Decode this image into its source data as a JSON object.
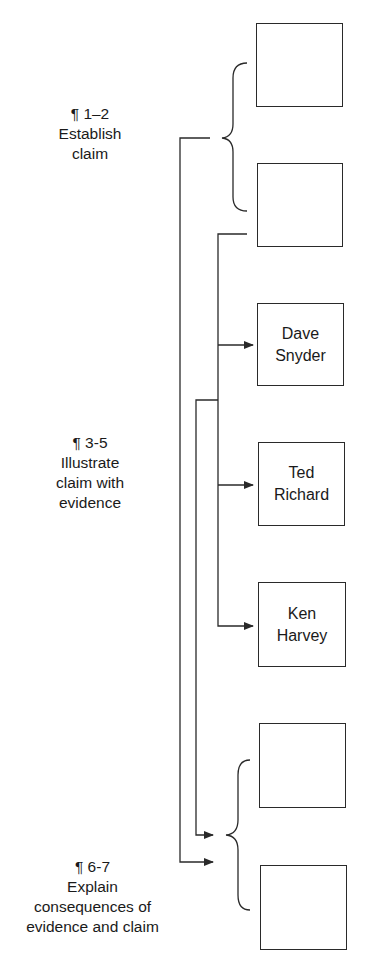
{
  "labels": [
    {
      "id": "establish",
      "line1": "¶ 1–2",
      "line2": "Establish",
      "line3": "claim"
    },
    {
      "id": "illustrate",
      "line1": "¶ 3-5",
      "line2": "Illustrate",
      "line3": "claim with",
      "line4": "evidence"
    },
    {
      "id": "explain",
      "line1": "¶ 6-7",
      "line2": "Explain",
      "line3": "consequences of",
      "line4": "evidence and claim"
    }
  ],
  "boxes": [
    {
      "id": "box-1",
      "line1": "",
      "line2": ""
    },
    {
      "id": "box-2",
      "line1": "",
      "line2": ""
    },
    {
      "id": "box-dave-snyder",
      "line1": "Dave",
      "line2": "Snyder"
    },
    {
      "id": "box-ted-richard",
      "line1": "Ted",
      "line2": "Richard"
    },
    {
      "id": "box-ken-harvey",
      "line1": "Ken",
      "line2": "Harvey"
    },
    {
      "id": "box-6",
      "line1": "",
      "line2": ""
    },
    {
      "id": "box-7",
      "line1": "",
      "line2": ""
    }
  ],
  "colors": {
    "stroke": "#2a2a2a",
    "background": "#ffffff"
  }
}
